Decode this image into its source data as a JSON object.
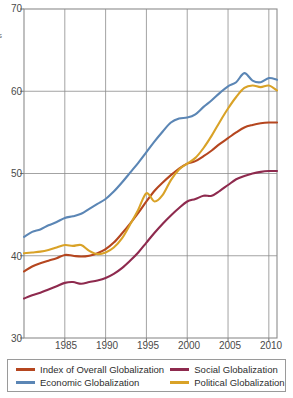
{
  "chart_data": {
    "type": "line",
    "title": "",
    "subtitle": "",
    "xlabel": "",
    "ylabel": "s",
    "ylabel_note": "partially cut-off vertical axis caption at left edge",
    "xlim": [
      1980,
      2011
    ],
    "ylim": [
      30,
      70
    ],
    "yticks": [
      30,
      40,
      50,
      60,
      70
    ],
    "xticks": [
      1985,
      1990,
      1995,
      2000,
      2005,
      2010
    ],
    "grid": true,
    "grid_color": "#8c8c8c",
    "legend_position": "below-plot",
    "x": [
      1980,
      1981,
      1982,
      1983,
      1984,
      1985,
      1986,
      1987,
      1988,
      1989,
      1990,
      1991,
      1992,
      1993,
      1994,
      1995,
      1996,
      1997,
      1998,
      1999,
      2000,
      2001,
      2002,
      2003,
      2004,
      2005,
      2006,
      2007,
      2008,
      2009,
      2010,
      2011
    ],
    "series": [
      {
        "name": "Index of Overall Globalization",
        "color": "#b5461f",
        "values": [
          38.1,
          38.7,
          39.1,
          39.4,
          39.7,
          40.1,
          40.0,
          39.9,
          40.0,
          40.3,
          40.8,
          41.6,
          42.7,
          43.9,
          45.2,
          46.6,
          47.9,
          48.9,
          49.8,
          50.6,
          51.2,
          51.5,
          52.1,
          52.8,
          53.6,
          54.3,
          55.0,
          55.6,
          55.9,
          56.1,
          56.2,
          56.2
        ]
      },
      {
        "name": "Economic Globalization",
        "color": "#5b86b5",
        "values": [
          42.3,
          42.9,
          43.2,
          43.7,
          44.1,
          44.6,
          44.8,
          45.1,
          45.7,
          46.3,
          46.9,
          47.8,
          48.9,
          50.1,
          51.3,
          52.6,
          53.9,
          55.1,
          56.2,
          56.7,
          56.8,
          57.2,
          58.1,
          58.9,
          59.8,
          60.6,
          61.1,
          62.2,
          61.3,
          61.1,
          61.6,
          61.4
        ]
      },
      {
        "name": "Social Globalization",
        "color": "#8e2a4e",
        "values": [
          34.8,
          35.2,
          35.5,
          35.9,
          36.3,
          36.7,
          36.8,
          36.6,
          36.8,
          37.0,
          37.3,
          37.8,
          38.5,
          39.4,
          40.4,
          41.6,
          42.8,
          43.9,
          44.9,
          45.8,
          46.6,
          46.9,
          47.3,
          47.3,
          47.9,
          48.6,
          49.3,
          49.7,
          50.0,
          50.2,
          50.3,
          50.3
        ]
      },
      {
        "name": "Political Globalization",
        "color": "#d9a227",
        "values": [
          40.3,
          40.4,
          40.5,
          40.7,
          41.0,
          41.3,
          41.2,
          41.3,
          40.6,
          40.2,
          40.4,
          41.0,
          42.1,
          43.8,
          45.6,
          47.6,
          46.6,
          47.4,
          49.2,
          50.5,
          51.2,
          51.9,
          53.1,
          54.6,
          56.3,
          57.9,
          59.3,
          60.4,
          60.7,
          60.5,
          60.7,
          60.1
        ]
      }
    ]
  },
  "axis": {
    "yticks": [
      {
        "label": "70",
        "value": 70
      },
      {
        "label": "60",
        "value": 60
      },
      {
        "label": "50",
        "value": 50
      },
      {
        "label": "40",
        "value": 40
      },
      {
        "label": "30",
        "value": 30
      }
    ],
    "xticks": [
      {
        "label": "1985",
        "value": 1985
      },
      {
        "label": "1990",
        "value": 1990
      },
      {
        "label": "1995",
        "value": 1995
      },
      {
        "label": "2000",
        "value": 2000
      },
      {
        "label": "2005",
        "value": 2005
      },
      {
        "label": "2010",
        "value": 2010
      }
    ],
    "ylabel_fragment": "s"
  },
  "legend": {
    "entries": [
      {
        "label": "Index of Overall Globalization",
        "color": "#b5461f"
      },
      {
        "label": "Social Globalization",
        "color": "#8e2a4e"
      },
      {
        "label": "Economic Globalization",
        "color": "#5b86b5"
      },
      {
        "label": "Political Globalization",
        "color": "#d9a227"
      }
    ]
  }
}
